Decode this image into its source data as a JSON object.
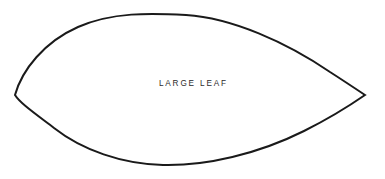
{
  "canvas": {
    "width": 385,
    "height": 179,
    "background_color": "#ffffff"
  },
  "diagram": {
    "kind": "leaf-outline",
    "label": "LARGE LEAF",
    "label_color": "#2b2b2b",
    "outline_color": "#1a1a1a",
    "outline_width": 2,
    "fill_color": "#ffffff",
    "geometry": {
      "left_tip": [
        15,
        95
      ],
      "right_tip": [
        365,
        95
      ],
      "top_apex": [
        176,
        14
      ],
      "bottom_apex": [
        166,
        165
      ],
      "path": "M 15 95 C 22 70 44 42 78 27 C 112 12 150 13 186 15 C 232 18 286 42 330 72 C 344 81 356 89 365 95 C 352 104 330 118 304 131 C 258 154 206 166 163 165 C 122 164 82 150 54 128 C 33 112 20 103 15 95 Z"
    }
  }
}
